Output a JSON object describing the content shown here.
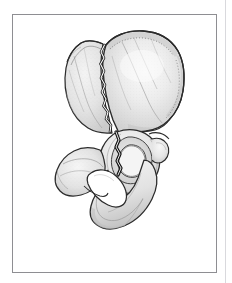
{
  "figure": {
    "kind": "anatomical-line-illustration",
    "title": "",
    "caption": "",
    "label_text": "",
    "has_text_labels": false
  },
  "canvas": {
    "width": 232,
    "height": 283,
    "background_color": "#ffffff"
  },
  "frame": {
    "name": "illustration-border",
    "x": 12,
    "y": 14,
    "width": 205,
    "height": 259,
    "border_color": "#8e8e92",
    "border_width": 1.5,
    "fill_color": "#ffffff"
  },
  "edge_rule": {
    "x": 225,
    "color": "#d9d9dd",
    "width": 1
  },
  "palette": {
    "outline": "#2b2b2b",
    "bone_fill_light": "#f2f2f2",
    "bone_fill_mid": "#e2e2e2",
    "bone_fill_shade": "#cfcfcf",
    "bone_fill_deep": "#bdbdbd",
    "stipple": "#9a9a9a",
    "fracture_dark": "#1a1a1a",
    "fracture_highlight": "#ffffff",
    "foramen_fill": "#ffffff"
  },
  "anatomy": {
    "parts": [
      {
        "id": "iliac-wing",
        "label": "Iliac wing (ala of ilium)"
      },
      {
        "id": "iliac-crest",
        "label": "Iliac crest"
      },
      {
        "id": "anterior-superior-iliac-spine",
        "label": "Anterior superior iliac spine"
      },
      {
        "id": "anterior-inferior-iliac-spine",
        "label": "Anterior inferior iliac spine"
      },
      {
        "id": "posterior-iliac-border",
        "label": "Posterior iliac border"
      },
      {
        "id": "greater-sciatic-notch",
        "label": "Greater sciatic notch"
      },
      {
        "id": "acetabulum",
        "label": "Acetabulum"
      },
      {
        "id": "lunate-surface",
        "label": "Lunate surface"
      },
      {
        "id": "acetabular-fossa",
        "label": "Acetabular fossa"
      },
      {
        "id": "superior-pubic-ramus",
        "label": "Superior pubic ramus"
      },
      {
        "id": "pubic-body",
        "label": "Body of pubis"
      },
      {
        "id": "inferior-pubic-ramus",
        "label": "Inferior pubic ramus"
      },
      {
        "id": "obturator-foramen",
        "label": "Obturator foramen"
      },
      {
        "id": "ischial-tuberosity",
        "label": "Ischial tuberosity"
      },
      {
        "id": "ischial-spine",
        "label": "Ischial spine"
      },
      {
        "id": "ischial-body",
        "label": "Body of ischium"
      }
    ],
    "fracture": {
      "id": "fracture-line",
      "label": "Fracture line",
      "description": "Jagged fracture traversing the iliac wing and extending through the acetabulum into the pubic ramus",
      "style": "dark jagged cleft with white highlight"
    }
  }
}
